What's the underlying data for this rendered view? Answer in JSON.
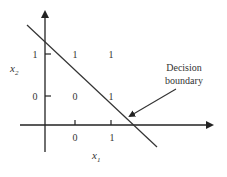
{
  "diagram": {
    "title": "",
    "axes": {
      "x_label": "x",
      "x_label_sub": "1",
      "y_label": "x",
      "y_label_sub": "2",
      "x_ticks": [
        "0",
        "1"
      ],
      "y_ticks": [
        "1",
        "0"
      ]
    },
    "points": [
      {
        "label": "1",
        "x_input": "0",
        "y_input": "1"
      },
      {
        "label": "1",
        "x_input": "1",
        "y_input": "1"
      },
      {
        "label": "0",
        "x_input": "0",
        "y_input": "0"
      },
      {
        "label": "1",
        "x_input": "1",
        "y_input": "0"
      }
    ],
    "annotation": {
      "line1": "Decision",
      "line2": "boundary"
    },
    "colors": {
      "ink": "#333333",
      "background": "#ffffff"
    }
  }
}
